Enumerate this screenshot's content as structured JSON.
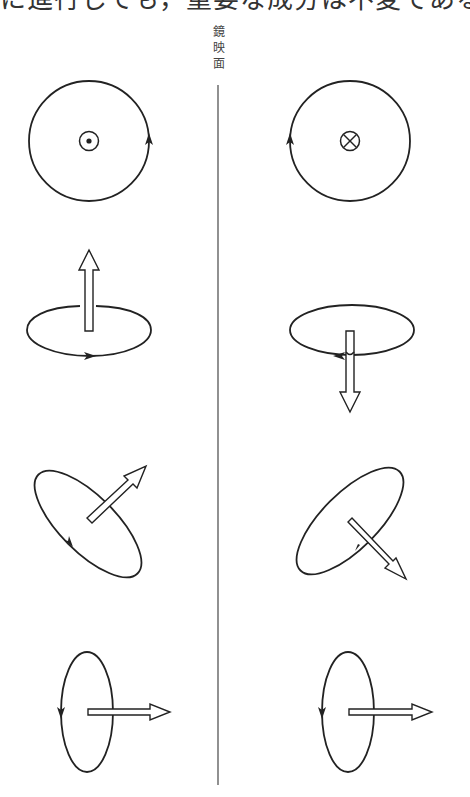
{
  "header": {
    "clipped_text": "に進行しても，重要な成分は不変である（図II."
  },
  "mirror": {
    "label_chars": [
      "鏡",
      "映",
      "面"
    ],
    "label": "鏡映面"
  },
  "diagram": {
    "colors": {
      "stroke": "#222222",
      "background": "#ffffff"
    },
    "rows": [
      {
        "id": 1,
        "left": {
          "shape": "circle",
          "center_symbol": "dot (out of page)",
          "rotation": "counterclockwise"
        },
        "right": {
          "shape": "circle",
          "center_symbol": "cross (into page)",
          "rotation": "clockwise"
        }
      },
      {
        "id": 2,
        "left": {
          "shape": "horizontal ellipse",
          "axial_arrow": "up"
        },
        "right": {
          "shape": "horizontal ellipse",
          "axial_arrow": "down"
        }
      },
      {
        "id": 3,
        "left": {
          "shape": "tilted ellipse",
          "axial_arrow": "up-right"
        },
        "right": {
          "shape": "tilted ellipse",
          "axial_arrow": "down-right"
        }
      },
      {
        "id": 4,
        "left": {
          "shape": "vertical ellipse",
          "axial_arrow": "right"
        },
        "right": {
          "shape": "vertical ellipse",
          "axial_arrow": "right"
        }
      }
    ]
  }
}
